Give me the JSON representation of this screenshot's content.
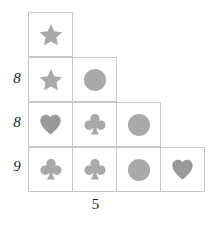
{
  "puzzle": {
    "background_color": "#ffffff",
    "grid_line_color": "#c8c8c8",
    "label_color": "#1c1c1c",
    "symbol_colors": {
      "star": "#a9a9a9",
      "circle": "#aaaaaa",
      "club": "#a9a9a9",
      "heart": "#999999"
    },
    "rows": [
      {
        "label": "",
        "cells": [
          {
            "symbol": "star"
          }
        ]
      },
      {
        "label": "8",
        "cells": [
          {
            "symbol": "star"
          },
          {
            "symbol": "circle"
          }
        ]
      },
      {
        "label": "8",
        "cells": [
          {
            "symbol": "heart"
          },
          {
            "symbol": "club"
          },
          {
            "symbol": "circle"
          }
        ]
      },
      {
        "label": "9",
        "cells": [
          {
            "symbol": "club"
          },
          {
            "symbol": "club"
          },
          {
            "symbol": "circle"
          },
          {
            "symbol": "heart"
          }
        ]
      }
    ],
    "bottom_label": "5"
  }
}
